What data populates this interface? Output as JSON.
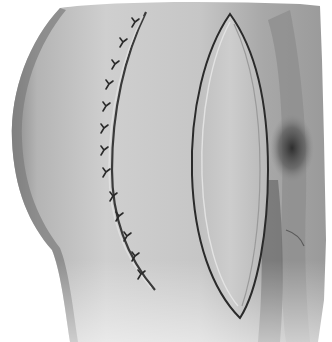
{
  "image": {
    "subject": "surgical illustration",
    "description": "Grayscale medical drawing of a limb/hip region showing a sutured curved incision on the left and an open elliptical (lens-shaped) wound on the right, with dark shading near the right edge",
    "palette": {
      "background": "#ffffff",
      "skin_light": "#d4d4d4",
      "skin_mid": "#b0b0b0",
      "skin_dark": "#7a7a7a",
      "shadow": "#3a3a3a",
      "line": "#2a2a2a",
      "wound_fill": "#c8c8c8",
      "wound_edge_highlight": "#e6e6e6"
    },
    "elements": {
      "sutured_incision": {
        "suture_count": 14
      },
      "elliptical_wound": {},
      "dark_crease_shadow": {}
    }
  }
}
